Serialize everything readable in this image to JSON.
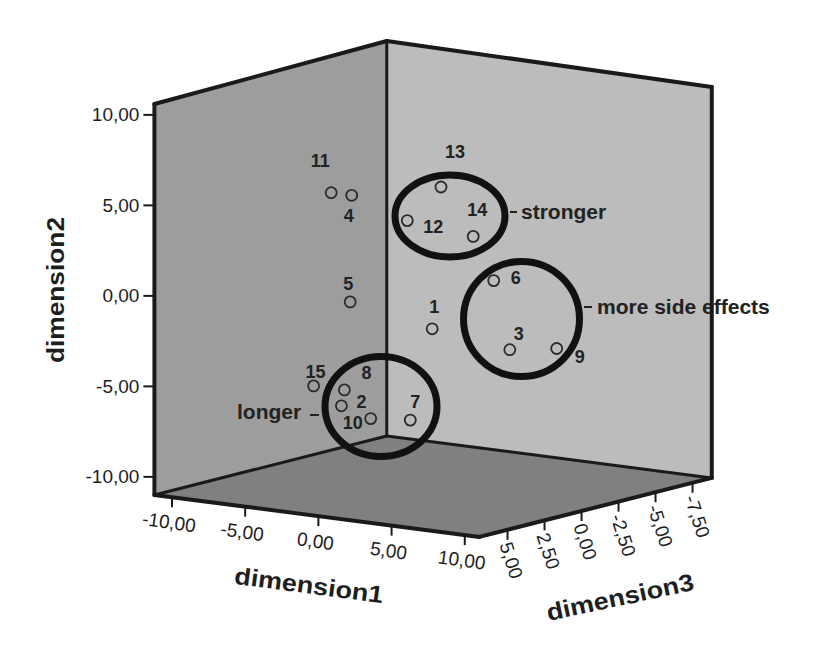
{
  "chart_data": {
    "type": "scatter",
    "projection": "3d",
    "title": "",
    "xlabel": "dimension1",
    "ylabel": "dimension2",
    "zlabel": "dimension3",
    "xlim": [
      -11.2,
      11.0
    ],
    "ylim": [
      -11.0,
      10.6
    ],
    "zlim": [
      -8.8,
      6.9
    ],
    "grid": false,
    "legend": "none",
    "xticks": [
      {
        "value": -10,
        "label": "-10,00"
      },
      {
        "value": -5,
        "label": "-5,00"
      },
      {
        "value": 0,
        "label": "0,00"
      },
      {
        "value": 5,
        "label": "5,00"
      },
      {
        "value": 10,
        "label": "10,00"
      }
    ],
    "yticks": [
      {
        "value": 10,
        "label": "10,00"
      },
      {
        "value": 5,
        "label": "5,00"
      },
      {
        "value": 0,
        "label": "0,00"
      },
      {
        "value": -5,
        "label": "-5,00"
      },
      {
        "value": -10,
        "label": "-10,00"
      }
    ],
    "zticks": [
      {
        "value": 5,
        "label": "5,00"
      },
      {
        "value": 2.5,
        "label": "2,50"
      },
      {
        "value": 0,
        "label": "0,00"
      },
      {
        "value": -2.5,
        "label": "-2,50"
      },
      {
        "value": -5,
        "label": "-5,00"
      },
      {
        "value": -7.5,
        "label": "-7,50"
      }
    ],
    "points_note": "dimension3 depth not recoverable from the 2D projection; estimated at 0",
    "points": [
      {
        "id": "1",
        "x": 0.8,
        "y": -2.0,
        "z": 0.0
      },
      {
        "id": "2",
        "x": -5.4,
        "y": -6.9,
        "z": 0.0
      },
      {
        "id": "3",
        "x": 6.1,
        "y": -2.6,
        "z": 0.0
      },
      {
        "id": "4",
        "x": -4.7,
        "y": 4.8,
        "z": 0.0
      },
      {
        "id": "5",
        "x": -4.8,
        "y": -1.1,
        "z": 0.0
      },
      {
        "id": "6",
        "x": 5.0,
        "y": 1.1,
        "z": 0.0
      },
      {
        "id": "7",
        "x": -0.7,
        "y": -7.2,
        "z": 0.0
      },
      {
        "id": "8",
        "x": -5.2,
        "y": -6.0,
        "z": 0.0
      },
      {
        "id": "9",
        "x": 9.3,
        "y": -2.2,
        "z": 0.0
      },
      {
        "id": "10",
        "x": -3.4,
        "y": -7.4,
        "z": 0.0
      },
      {
        "id": "11",
        "x": -6.1,
        "y": 4.8,
        "z": 0.0
      },
      {
        "id": "12",
        "x": -0.9,
        "y": 3.8,
        "z": 0.0
      },
      {
        "id": "13",
        "x": 1.4,
        "y": 5.9,
        "z": 0.0
      },
      {
        "id": "14",
        "x": 3.6,
        "y": 3.4,
        "z": 0.0
      },
      {
        "id": "15",
        "x": -7.3,
        "y": -6.0,
        "z": 0.0
      }
    ],
    "annotations": [
      {
        "label": "stronger",
        "members": [
          "12",
          "13",
          "14"
        ]
      },
      {
        "label": "more side effects",
        "members": [
          "3",
          "6",
          "9"
        ]
      },
      {
        "label": "longer",
        "members": [
          "2",
          "7",
          "8",
          "10"
        ]
      }
    ]
  },
  "colors": {
    "left_wall": "#9d9d9d",
    "right_wall": "#bcbcbc",
    "floor": "#808080",
    "frame": "#1a1a1a",
    "marker": "#2b2b2b",
    "annotation": "#111111"
  }
}
